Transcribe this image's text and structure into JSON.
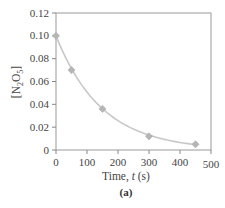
{
  "chart_data": {
    "type": "scatter",
    "title": "",
    "caption": "(a)",
    "xlabel": "Time, t (s)",
    "xlabel_parts": {
      "prefix": "Time, ",
      "var": "t",
      "suffix": " (s)"
    },
    "ylabel": "[N2O5]",
    "ylabel_parts": {
      "open": "[N",
      "sub1": "2",
      "mid": "O",
      "sub2": "5",
      "close": "]"
    },
    "xlim": [
      0,
      500
    ],
    "ylim": [
      0,
      0.12
    ],
    "xticks": [
      0,
      100,
      200,
      300,
      400,
      500
    ],
    "xtick_labels": [
      "0",
      "100",
      "200",
      "300",
      "400",
      "500"
    ],
    "yticks": [
      0,
      0.02,
      0.04,
      0.06,
      0.08,
      0.1,
      0.12
    ],
    "ytick_labels": [
      "0",
      "0.02",
      "0.04",
      "0.06",
      "0.08",
      "0.10",
      "0.12"
    ],
    "grid": false,
    "legend": null,
    "series": [
      {
        "name": "[N2O5] data",
        "marker": "diamond",
        "color": "#b5b5b5",
        "x": [
          0,
          50,
          150,
          300,
          450
        ],
        "y": [
          0.1,
          0.07,
          0.036,
          0.012,
          0.005
        ]
      },
      {
        "name": "exponential fit",
        "type": "line",
        "color": "#c8c8c8",
        "curve": "smooth decay through data"
      }
    ]
  }
}
